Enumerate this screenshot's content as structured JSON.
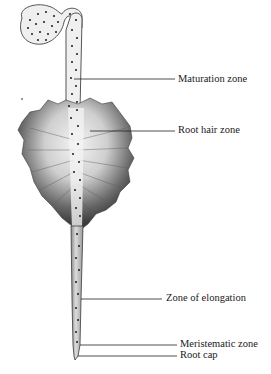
{
  "diagram": {
    "labels": [
      {
        "id": "maturation",
        "text": "Maturation zone",
        "x": 178,
        "y": 74,
        "line_y": 79,
        "line_x1": 74,
        "line_x2": 175
      },
      {
        "id": "root-hair",
        "text": "Root hair zone",
        "x": 178,
        "y": 125,
        "line_y": 131,
        "line_x1": 90,
        "line_x2": 175
      },
      {
        "id": "elongation",
        "text": "Zone of elongation",
        "x": 166,
        "y": 294,
        "line_y": 299,
        "line_x1": 81,
        "line_x2": 162
      },
      {
        "id": "meristematic",
        "text": "Meristematic zone",
        "x": 180,
        "y": 340,
        "line_y": 345,
        "line_x1": 80,
        "line_x2": 177
      },
      {
        "id": "root-cap",
        "text": "Root cap",
        "x": 180,
        "y": 351,
        "line_y": 356,
        "line_x1": 80,
        "line_x2": 177
      }
    ],
    "colors": {
      "outline": "#3a3a3a",
      "fill_light": "#ececec",
      "fill_mid": "#c9c9c9",
      "hair_dark": "#4a4a4a",
      "dot": "#1a1a1a",
      "leader_line": "#222222"
    }
  }
}
